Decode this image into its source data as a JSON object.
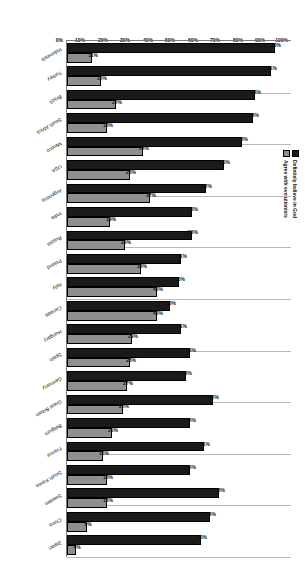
{
  "chart_data": {
    "type": "bar",
    "title": "",
    "xlabel": "",
    "ylabel": "",
    "ylim": [
      0,
      100
    ],
    "ytick_labels": [
      "0%",
      "10%",
      "20%",
      "30%",
      "40%",
      "50%",
      "60%",
      "70%",
      "80%",
      "90%",
      "100%"
    ],
    "ytick_values": [
      0,
      10,
      20,
      30,
      40,
      50,
      60,
      70,
      80,
      90,
      100
    ],
    "grid": true,
    "legend_position": "top-center",
    "categories": [
      "Indonesia",
      "Turkey",
      "Brazil",
      "South Africa",
      "Mexico",
      "USA",
      "Argentina",
      "India",
      "Russia",
      "Poland",
      "Italy",
      "Canada",
      "Hungary",
      "Spain",
      "Germany",
      "Great Britain",
      "Belgium",
      "France",
      "South Korea",
      "Sweden",
      "China",
      "Japan"
    ],
    "series": [
      {
        "name": "Definitely believe in God",
        "color": "#1a1a1a",
        "values": [
          93,
          91,
          84,
          83,
          78,
          70,
          62,
          56,
          56,
          51,
          50,
          46,
          51,
          55,
          53,
          65,
          55,
          61,
          55,
          68,
          64,
          60
        ],
        "value_labels": [
          "93%",
          "91%",
          "84%",
          "83%",
          "78%",
          "70%",
          "62%",
          "56%",
          "56%",
          "51%",
          "50%",
          "46%",
          "51%",
          "55%",
          "53%",
          "65%",
          "55%",
          "61%",
          "55%",
          "68%",
          "64%",
          "60%"
        ]
      },
      {
        "name": "Agree with evolutionists",
        "color": "#8f8f8f",
        "values": [
          11,
          15,
          22,
          18,
          34,
          28,
          37,
          19,
          26,
          33,
          40,
          40,
          29,
          28,
          27,
          25,
          20,
          16,
          18,
          18,
          9,
          4
        ],
        "value_labels": [
          "11%",
          "15%",
          "22%",
          "18%",
          "34%",
          "28%",
          "37%",
          "19%",
          "26%",
          "33%",
          "40%",
          "40%",
          "29%",
          "28%",
          "27%",
          "25%",
          "20%",
          "16%",
          "18%",
          "18%",
          "9%",
          "4%"
        ]
      }
    ]
  },
  "legend": {
    "items": [
      {
        "label": "Definitely believe in God",
        "color": "#1a1a1a"
      },
      {
        "label": "Agree with evolutionists",
        "color": "#8f8f8f"
      }
    ]
  }
}
